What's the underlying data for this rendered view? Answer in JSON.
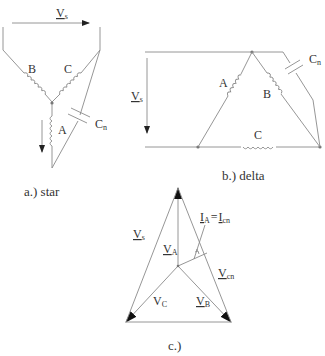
{
  "figure": {
    "star": {
      "caption": "a.) star",
      "labels": {
        "vs_main": "V",
        "vs_sub": "s",
        "coil_b": "B",
        "coil_c": "C",
        "coil_a": "A",
        "cap_main": "C",
        "cap_sub": "n"
      }
    },
    "delta": {
      "caption": "b.) delta",
      "labels": {
        "vs_main": "V",
        "vs_sub": "s",
        "coil_a": "A",
        "coil_b": "B",
        "coil_c": "C",
        "cap_main": "C",
        "cap_sub": "n"
      }
    },
    "phasor": {
      "caption": "c.)",
      "labels": {
        "vs_main": "V",
        "vs_sub": "s",
        "va_main": "V",
        "va_sub": "A",
        "vb_main": "V",
        "vb_sub": "B",
        "vc_main": "V",
        "vc_sub": "C",
        "vcn_main": "V",
        "vcn_sub": "cn",
        "ia_main": "I",
        "ia_sub": "A",
        "equals": "=",
        "icn_main": "I",
        "icn_sub": "cn"
      }
    },
    "colors": {
      "line": "#8a8a8a",
      "text": "#333333",
      "arrow": "#222222",
      "background": "#ffffff"
    }
  }
}
